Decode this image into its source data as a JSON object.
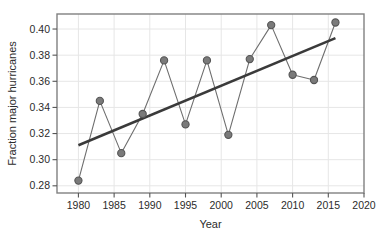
{
  "chart_data": {
    "type": "line",
    "title": "",
    "subtitle": "",
    "xlabel": "Year",
    "ylabel": "Fraction major hurricanes",
    "x": [
      1980,
      1983,
      1986,
      1989,
      1992,
      1995,
      1998,
      2001,
      2004,
      2007,
      2010,
      2013,
      2016
    ],
    "series": [
      {
        "name": "Fraction major hurricanes",
        "values": [
          0.284,
          0.345,
          0.305,
          0.335,
          0.376,
          0.327,
          0.376,
          0.319,
          0.377,
          0.403,
          0.365,
          0.361,
          0.405
        ],
        "color": "#6e6e6e",
        "marker": "circle",
        "marker_color": "#7a7a7a",
        "marker_edge_color": "#545454"
      },
      {
        "name": "Linear trend",
        "type": "trendline",
        "x": [
          1980,
          2016
        ],
        "values": [
          0.311,
          0.393
        ],
        "color": "#3a3a3a"
      }
    ],
    "xlim": [
      1977,
      2020
    ],
    "ylim": [
      0.2745,
      0.4115
    ],
    "xticks": [
      1980,
      1985,
      1990,
      1995,
      2000,
      2005,
      2010,
      2015,
      2020
    ],
    "xtick_labels": [
      "1980",
      "1985",
      "1990",
      "1995",
      "2000",
      "2005",
      "2010",
      "2015",
      "2020"
    ],
    "yticks": [
      0.28,
      0.3,
      0.32,
      0.34,
      0.36,
      0.38,
      0.4
    ],
    "ytick_labels": [
      "0.28",
      "0.30",
      "0.32",
      "0.34",
      "0.36",
      "0.38",
      "0.40"
    ],
    "grid": true,
    "grid_color": "#e6e6e6",
    "legend": false,
    "legend_position": "none",
    "frame_color": "#808080",
    "background": "#ffffff"
  }
}
